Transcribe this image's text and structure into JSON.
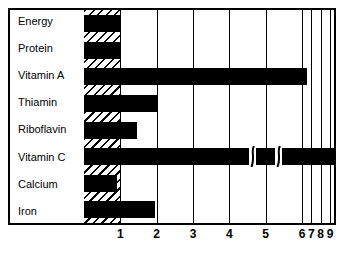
{
  "chart_data": {
    "type": "bar",
    "orientation": "horizontal",
    "title": "",
    "xlabel": "",
    "ylabel": "",
    "categories": [
      "Energy",
      "Protein",
      "Vitamin A",
      "Thiamin",
      "Riboflavin",
      "Vitamin C",
      "Calcium",
      "Iron"
    ],
    "values": [
      1.0,
      1.0,
      6.5,
      2.05,
      1.45,
      16.0,
      0.9,
      1.95
    ],
    "value_labels": [
      "",
      "",
      "",
      "",
      "",
      "16.0",
      "",
      ""
    ],
    "xticks": [
      1,
      2,
      3,
      4,
      5,
      6,
      7,
      8,
      9
    ],
    "xtick_labels": [
      "1",
      "2",
      "3",
      "4",
      "5",
      "6",
      "7",
      "8",
      "9"
    ],
    "xlim": [
      0,
      9
    ],
    "grid": true,
    "axis_break": true,
    "shaded_band": [
      0,
      1
    ],
    "band_style": "diagonal-hatch",
    "bar_color": "#000000",
    "background_color": "#ffffff"
  },
  "colors": {
    "bar": "#000000",
    "frame": "#000000",
    "background": "#ffffff",
    "label_text": "#000000"
  }
}
